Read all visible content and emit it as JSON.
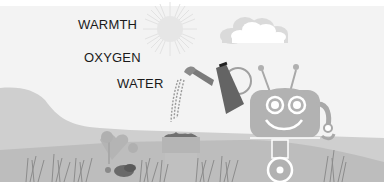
{
  "scene": {
    "description": "Grayscale illustration of a friendly robot watering a potted plant in a meadow",
    "background_color": "#f3f3f3",
    "hill_color": "#c8c8c8",
    "ground_color": "#b9b9b9"
  },
  "labels": {
    "warmth": "WARMTH",
    "oxygen": "OXYGEN",
    "water": "WATER"
  },
  "elements": {
    "sun": "sun-icon",
    "cloud": "cloud-icon",
    "watering_can": "watering-can-icon",
    "robot": "robot-icon",
    "plant_pot": "plant-pot-icon",
    "flowers": "flowers-icon",
    "grass": "grass-icon"
  }
}
